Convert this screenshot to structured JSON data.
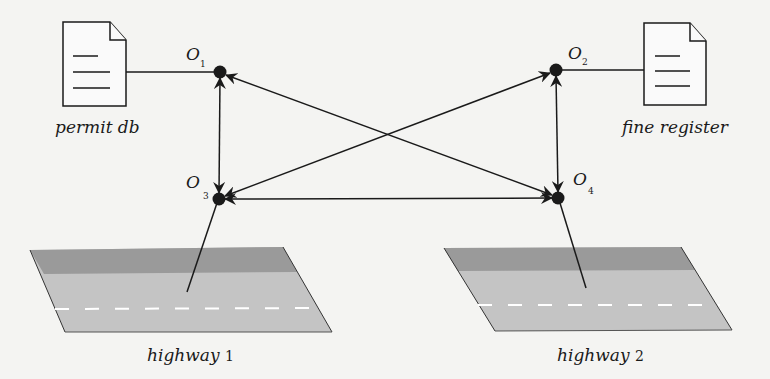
{
  "diagram": {
    "nodes": [
      {
        "id": "O1",
        "label": "O",
        "subscript": "1",
        "x": 220,
        "y": 72
      },
      {
        "id": "O2",
        "label": "O",
        "subscript": "2",
        "x": 556,
        "y": 70
      },
      {
        "id": "O3",
        "label": "O",
        "subscript": "3",
        "x": 219,
        "y": 199
      },
      {
        "id": "O4",
        "label": "O",
        "subscript": "4",
        "x": 558,
        "y": 198
      }
    ],
    "documents": [
      {
        "id": "permit-db",
        "label": "permit db",
        "attached_to": "O1"
      },
      {
        "id": "fine-register",
        "label": "fine register",
        "attached_to": "O2"
      }
    ],
    "highways": [
      {
        "id": "highway-1",
        "label": "highway",
        "number": "1",
        "attached_to": "O3"
      },
      {
        "id": "highway-2",
        "label": "highway",
        "number": "2",
        "attached_to": "O4"
      }
    ],
    "edges": [
      {
        "from": "O1",
        "to": "O3",
        "type": "bidirectional"
      },
      {
        "from": "O2",
        "to": "O4",
        "type": "bidirectional"
      },
      {
        "from": "O3",
        "to": "O4",
        "type": "bidirectional"
      },
      {
        "from": "O1",
        "to": "O4",
        "type": "bidirectional"
      },
      {
        "from": "O3",
        "to": "O2",
        "type": "bidirectional"
      }
    ],
    "colors": {
      "ink": "#1a1a1a",
      "road_dark": "#9a9a9a",
      "road_light": "#c4c4c4",
      "lane_marking": "#ffffff",
      "background": "#f4f4f2"
    }
  }
}
